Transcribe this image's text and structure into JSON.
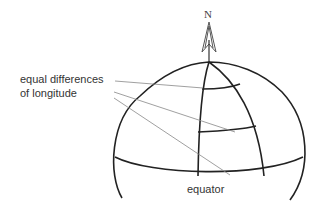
{
  "diagram": {
    "north_label": "N",
    "annotation_line1": "equal differences",
    "annotation_line2": "of longitude",
    "equator_label": "equator",
    "colors": {
      "stroke": "#222222",
      "leader": "#888888",
      "text": "#333333"
    }
  }
}
